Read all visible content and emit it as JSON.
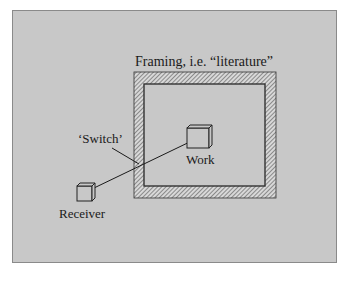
{
  "diagram": {
    "frame_label": "Framing, i.e. “literature”",
    "switch_label": "‘Switch’",
    "work_label": "Work",
    "receiver_label": "Receiver"
  },
  "colors": {
    "background": "#c8c8c8",
    "border": "#8a8a8a",
    "line": "#1a1a1a",
    "hatch": "#555555"
  }
}
